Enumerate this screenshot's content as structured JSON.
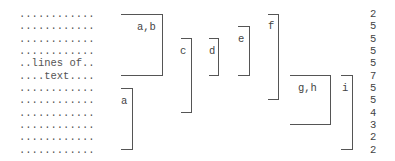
{
  "text_lines": [
    "............",
    "............",
    "............",
    "............",
    "..lines of..",
    "....text....",
    "............",
    "............",
    "............",
    "............",
    "............",
    "............"
  ],
  "brackets": [
    {
      "label": "a,b"
    },
    {
      "label": "c"
    },
    {
      "label": "d"
    },
    {
      "label": "e"
    },
    {
      "label": "f"
    },
    {
      "label": "g,h"
    },
    {
      "label": "i"
    },
    {
      "label": "a"
    }
  ],
  "line_counts": [
    "2",
    "5",
    "5",
    "5",
    "5",
    "7",
    "5",
    "5",
    "4",
    "3",
    "2",
    "2"
  ]
}
